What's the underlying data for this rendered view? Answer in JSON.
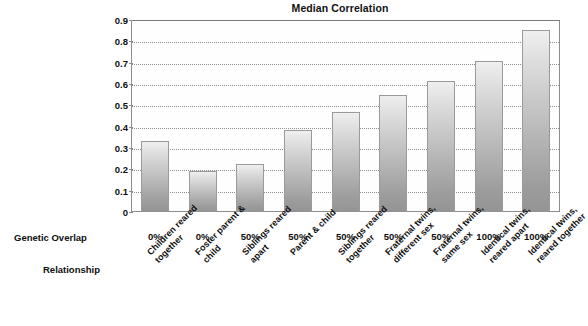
{
  "chart_data": {
    "type": "bar",
    "title": "Median Correlation",
    "xlabel": "",
    "ylabel": "",
    "ylim": [
      0,
      0.9
    ],
    "grid": true,
    "legend": false,
    "yticks": [
      "0.9",
      "0.8",
      "0.7",
      "0.6",
      "0.5",
      "0.4",
      "0.3",
      "0.2",
      "0.1",
      "0"
    ],
    "ytick_values": [
      0.9,
      0.8,
      0.7,
      0.6,
      0.5,
      0.4,
      0.3,
      0.2,
      0.1,
      0
    ],
    "categories": [
      "Children reared\ntogether",
      "Foster parent &\nchild",
      "Siblings reared\napart",
      "Parent & child",
      "Siblings reared\ntogether",
      "Fraternal twins,\ndifferent sex",
      "Fraternal twins,\nsame sex",
      "Identical twins,\nreared apart",
      "Identical twins,\nreared together"
    ],
    "values": [
      0.335,
      0.19,
      0.225,
      0.385,
      0.47,
      0.55,
      0.615,
      0.71,
      0.855
    ],
    "secondary_axis": {
      "label": "Genetic Overlap",
      "values": [
        "0%",
        "0%",
        "50%",
        "50%",
        "50%",
        "50%",
        "50%",
        "100%",
        "100%"
      ]
    },
    "category_axis_label": "Relationship"
  },
  "colors": {
    "bar_top": "#efefef",
    "bar_bottom": "#949494",
    "bar_border": "#9a9a9a",
    "frame": "#8d8d8d",
    "gridline": "#8e8e8e",
    "text": "#0f0f0f",
    "background": "#ffffff"
  }
}
